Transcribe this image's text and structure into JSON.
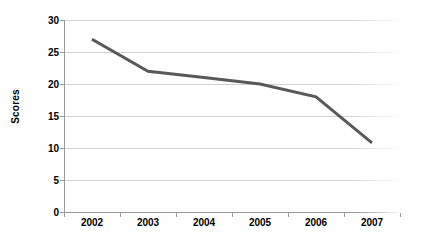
{
  "chart_data": {
    "type": "line",
    "title": "",
    "xlabel": "",
    "ylabel": "Scores",
    "categories": [
      "2002",
      "2003",
      "2004",
      "2005",
      "2006",
      "2007"
    ],
    "values": [
      27,
      22,
      21,
      20,
      18,
      10.8
    ],
    "series": [
      {
        "name": "Scores",
        "values": [
          27,
          22,
          21,
          20,
          18,
          10.8
        ]
      }
    ],
    "ylim": [
      0,
      30
    ],
    "y_ticks": [
      0,
      5,
      10,
      15,
      20,
      25,
      30
    ],
    "y_tick_labels": [
      "0",
      "5",
      "10",
      "15",
      "20",
      "25",
      "30"
    ],
    "grid": true,
    "grid_axis": "y",
    "legend": false,
    "legend_position": "none",
    "line_color": "#595959",
    "grid_color": "#d2d2d2",
    "axis_color": "#9a9a9a",
    "text_color": "#000000",
    "background": "#ffffff",
    "line_width": 3
  }
}
